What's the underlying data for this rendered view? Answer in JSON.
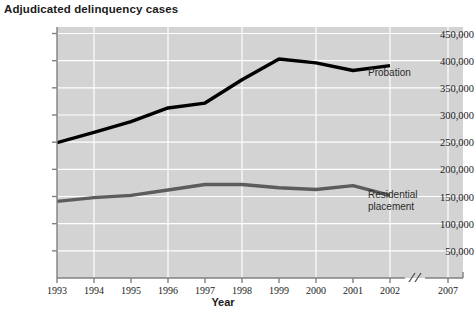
{
  "chart_data": {
    "type": "line",
    "title": "Adjudicated delinquency cases",
    "xlabel": "Year",
    "ylabel": "",
    "x": [
      1993,
      1994,
      1995,
      1996,
      1997,
      1998,
      1999,
      2000,
      2001,
      2002
    ],
    "categories": [
      "1993",
      "1994",
      "1995",
      "1996",
      "1997",
      "1998",
      "1999",
      "2000",
      "2001",
      "2002"
    ],
    "xtick_labels": [
      "1993",
      "1994",
      "1995",
      "1996",
      "1997",
      "1998",
      "1999",
      "2000",
      "2001",
      "2002",
      "2007"
    ],
    "xaxis_break": {
      "present": true,
      "symbol": "//",
      "between": [
        "2002",
        "2007"
      ],
      "note": "axis break between 2002 and 2007"
    },
    "ytick_labels": [
      "450,000",
      "400,000",
      "350,000",
      "300,000",
      "250,000",
      "200,000",
      "150,000",
      "100,000",
      "50,000"
    ],
    "ytick_values": [
      450000,
      400000,
      350000,
      300000,
      250000,
      200000,
      150000,
      100000,
      50000
    ],
    "ylim": [
      0,
      462000
    ],
    "xlim": [
      1993,
      2002
    ],
    "grid": true,
    "grid_color": "#ffffff",
    "plot_background": "#d3d3d3",
    "legend_position": "inline-annotations",
    "series": [
      {
        "name": "Probation",
        "color": "#000000",
        "line_width": 3.4,
        "label_text": "Probation",
        "values": [
          249000,
          268000,
          288000,
          313000,
          322000,
          365000,
          403000,
          396000,
          382000,
          391000
        ]
      },
      {
        "name": "Residential placement",
        "color": "#5c5c5c",
        "line_width": 3.4,
        "label_text_line1": "Residential",
        "label_text_line2": "placement",
        "values": [
          141000,
          148000,
          152000,
          162000,
          172000,
          172000,
          166000,
          163000,
          170000,
          152000
        ]
      }
    ]
  }
}
